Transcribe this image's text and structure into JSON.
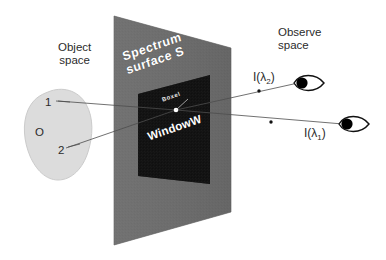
{
  "figure": {
    "background_color": "#ffffff"
  },
  "labels": {
    "object_space": "Object\nspace",
    "observe_space": "Observe\nspace",
    "spectrum_surface": "Spectrum\nsurface S",
    "window": "WindowW",
    "boxel": "Boxel",
    "object_point_1": "1",
    "object_center": "O",
    "object_point_2": "2",
    "intensity_lambda_2_prefix": "I(",
    "intensity_lambda_2_symbol": "λ",
    "intensity_lambda_2_sub": "2",
    "intensity_lambda_2_suffix": ")",
    "intensity_lambda_1_prefix": "I(",
    "intensity_lambda_1_symbol": "λ",
    "intensity_lambda_1_sub": "1",
    "intensity_lambda_1_suffix": ")"
  },
  "colors": {
    "plane_gray": "#6e6e6e",
    "plane_gray_dark": "#5f5f5f",
    "window_black": "#151515",
    "object_blob": "#dcdcdc",
    "object_blob_stroke": "#c2c2c2",
    "text_dark": "#2b2b2b",
    "text_light": "#ffffff",
    "ray_line": "#555555",
    "eye_fill": "#000000",
    "boxel_dot": "#ffffff"
  },
  "geometry": {
    "plane_corners": [
      [
        114,
        16
      ],
      [
        231,
        48
      ],
      [
        231,
        212
      ],
      [
        114,
        245
      ]
    ],
    "window_corners": [
      [
        138,
        94
      ],
      [
        210,
        75
      ],
      [
        210,
        183
      ],
      [
        138,
        175
      ]
    ],
    "boxel_point": [
      176,
      110
    ],
    "object_blob_center": [
      60,
      135
    ],
    "eye_upper": [
      305,
      83
    ],
    "eye_lower": [
      350,
      124
    ],
    "ray_marker_upper": [
      259,
      91
    ],
    "ray_marker_lower": [
      271,
      122
    ]
  },
  "elements": {
    "plane_name": "spectrum-surface-plane",
    "window_name": "window-w-region",
    "blob_name": "object-blob",
    "eye_upper_name": "observer-eye-lambda-2",
    "eye_lower_name": "observer-eye-lambda-1"
  }
}
